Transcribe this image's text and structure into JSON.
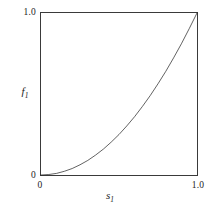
{
  "chart_data": {
    "type": "line",
    "title": "",
    "subtitle": "",
    "xlabel": "s",
    "xlabel_sub": "1",
    "ylabel": "f",
    "ylabel_sub": "1",
    "xlim": [
      0,
      1
    ],
    "ylim": [
      0,
      1
    ],
    "grid": false,
    "legend": null,
    "x_ticks": [
      "0",
      "1.0"
    ],
    "y_ticks": [
      "0",
      "1.0"
    ],
    "x_tick_values": [
      0,
      1
    ],
    "y_tick_values": [
      0,
      1
    ],
    "series": [
      {
        "name": "f1 = s1^2",
        "x": [
          0.0,
          0.05,
          0.1,
          0.15,
          0.2,
          0.25,
          0.3,
          0.35,
          0.4,
          0.45,
          0.5,
          0.55,
          0.6,
          0.65,
          0.7,
          0.75,
          0.8,
          0.85,
          0.9,
          0.95,
          1.0
        ],
        "values": [
          0.0,
          0.003,
          0.01,
          0.023,
          0.04,
          0.063,
          0.09,
          0.123,
          0.16,
          0.203,
          0.25,
          0.303,
          0.36,
          0.423,
          0.49,
          0.563,
          0.64,
          0.723,
          0.81,
          0.903,
          1.0
        ],
        "color": "#1f1f1f",
        "line_width": 1
      }
    ],
    "annotations": []
  },
  "style": {
    "background": "#ffffff",
    "frame_color": "#3a3a3a",
    "text_color": "#1c1c1c",
    "curve_color": "#1f1f1f"
  }
}
